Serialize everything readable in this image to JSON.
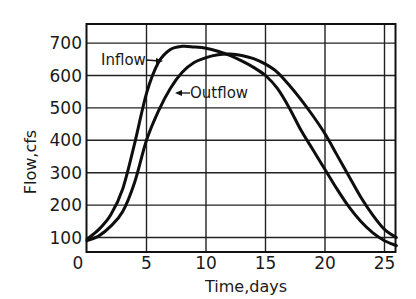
{
  "chart_data": {
    "type": "line",
    "title": "",
    "xlabel": "Time,days",
    "ylabel": "Flow,cfs",
    "xlim": [
      0,
      26
    ],
    "ylim": [
      50,
      750
    ],
    "grid": true,
    "legend_position": "inline annotations",
    "x_ticks": [
      "0",
      "5",
      "10",
      "15",
      "20",
      "25"
    ],
    "x_tick_values": [
      0,
      5,
      10,
      15,
      20,
      25
    ],
    "y_ticks": [
      "100",
      "200",
      "300",
      "400",
      "500",
      "600",
      "700"
    ],
    "y_tick_values": [
      100,
      200,
      300,
      400,
      500,
      600,
      700
    ],
    "annotations": [
      {
        "text": "Inflow",
        "points_to": "Inflow curve near day 6.5, 660 cfs"
      },
      {
        "text": "Outflow",
        "points_to": "Outflow curve near day 8.5, 550 cfs"
      }
    ],
    "series": [
      {
        "name": "Inflow",
        "x": [
          0,
          1,
          2,
          3,
          4,
          5,
          6,
          7,
          8,
          9,
          10,
          11,
          12,
          13,
          14,
          15,
          16,
          17,
          18,
          19,
          20,
          21,
          22,
          23,
          24,
          25,
          26
        ],
        "values": [
          95,
          125,
          170,
          250,
          390,
          545,
          640,
          680,
          690,
          688,
          684,
          675,
          662,
          645,
          625,
          600,
          560,
          500,
          430,
          370,
          310,
          250,
          195,
          150,
          115,
          90,
          75
        ]
      },
      {
        "name": "Outflow",
        "x": [
          0,
          1,
          2,
          3,
          4,
          5,
          6,
          7,
          8,
          9,
          10,
          11,
          12,
          13,
          14,
          15,
          16,
          17,
          18,
          19,
          20,
          21,
          22,
          23,
          24,
          25,
          26
        ],
        "values": [
          90,
          105,
          135,
          180,
          270,
          400,
          490,
          560,
          610,
          640,
          655,
          664,
          666,
          662,
          652,
          635,
          610,
          570,
          525,
          475,
          420,
          355,
          290,
          225,
          170,
          125,
          100
        ]
      }
    ]
  }
}
